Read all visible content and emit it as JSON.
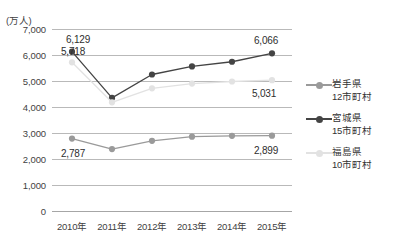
{
  "chart_data": {
    "type": "line",
    "title": "",
    "unit_label": "(万人)",
    "xlabel": "",
    "ylabel": "",
    "categories": [
      "2010年",
      "2011年",
      "2012年",
      "2013年",
      "2014年",
      "2015年"
    ],
    "ylim": [
      0,
      7000
    ],
    "ytick_values": [
      0,
      1000,
      2000,
      3000,
      4000,
      5000,
      6000,
      7000
    ],
    "ytick_labels": [
      "0",
      "1,000",
      "2,000",
      "3,000",
      "4,000",
      "5,000",
      "6,000",
      "7,000"
    ],
    "grid": true,
    "legend_position": "right",
    "series": [
      {
        "name": "岩手県",
        "sub": "12市町村",
        "color": "#9a9a9a",
        "values": [
          2787,
          2380,
          2700,
          2860,
          2890,
          2899
        ]
      },
      {
        "name": "宮城県",
        "sub": "15市町村",
        "color": "#444444",
        "values": [
          6129,
          4350,
          5250,
          5560,
          5740,
          6066
        ]
      },
      {
        "name": "福島県",
        "sub": "10市町村",
        "color": "#e2e2e2",
        "values": [
          5718,
          4180,
          4720,
          4900,
          4980,
          5031
        ]
      }
    ],
    "annotations": [
      {
        "text": "6,129",
        "series": "宮城県",
        "x_index": 0,
        "value": 6129
      },
      {
        "text": "5,718",
        "series": "福島県",
        "x_index": 0,
        "value": 5718
      },
      {
        "text": "2,787",
        "series": "岩手県",
        "x_index": 0,
        "value": 2787
      },
      {
        "text": "6,066",
        "series": "宮城県",
        "x_index": 5,
        "value": 6066
      },
      {
        "text": "5,031",
        "series": "福島県",
        "x_index": 5,
        "value": 5031
      },
      {
        "text": "2,899",
        "series": "岩手県",
        "x_index": 5,
        "value": 2899
      }
    ]
  },
  "legend": {
    "items": [
      {
        "label": "岩手県",
        "sublabel": "12市町村"
      },
      {
        "label": "宮城県",
        "sublabel": "15市町村"
      },
      {
        "label": "福島県",
        "sublabel": "10市町村"
      }
    ]
  }
}
